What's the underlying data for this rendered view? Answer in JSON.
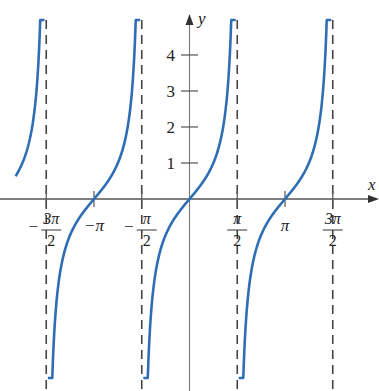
{
  "chart_data": {
    "type": "line",
    "title": "",
    "function": "y = tan x",
    "xlabel": "x",
    "ylabel": "y",
    "xlim": [
      -5.95,
      6.2
    ],
    "ylim": [
      -5.3,
      5.0
    ],
    "grid": false,
    "legend": null,
    "x_ticks": [
      {
        "value": -4.712389,
        "label_num": "3π",
        "label_den": "2",
        "sign": "−"
      },
      {
        "value": -3.141593,
        "label": "−π"
      },
      {
        "value": -1.570796,
        "label_num": "π",
        "label_den": "2",
        "sign": "−"
      },
      {
        "value": 1.570796,
        "label_num": "π",
        "label_den": "2",
        "sign": ""
      },
      {
        "value": 3.141593,
        "label": "π"
      },
      {
        "value": 4.712389,
        "label_num": "3π",
        "label_den": "2",
        "sign": ""
      }
    ],
    "y_ticks": [
      1,
      2,
      3,
      4
    ],
    "y_tick_labels": [
      "1",
      "2",
      "3",
      "4"
    ],
    "asymptotes": [
      -4.712389,
      -1.570796,
      1.570796,
      4.712389
    ],
    "series": [
      {
        "name": "tan x",
        "color": "#2f6db5",
        "x_range": [
          -5.72,
          -4.77
        ]
      },
      {
        "name": "tan x",
        "color": "#2f6db5",
        "x_range": [
          -4.66,
          -1.62
        ]
      },
      {
        "name": "tan x",
        "color": "#2f6db5",
        "x_range": [
          -1.52,
          1.52
        ]
      },
      {
        "name": "tan x",
        "color": "#2f6db5",
        "x_range": [
          1.62,
          4.665
        ]
      }
    ],
    "colors": {
      "curve": "#2f6db5",
      "axis": "#555555",
      "asymptote": "#444444"
    }
  },
  "labels": {
    "x_axis": "x",
    "y_axis": "y"
  }
}
